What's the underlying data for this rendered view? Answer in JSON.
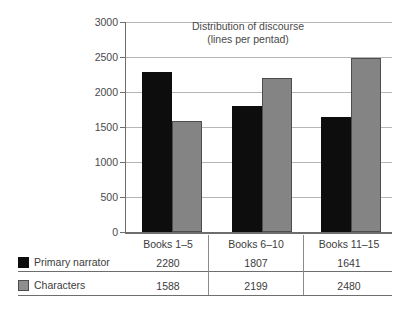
{
  "chart_data": {
    "type": "bar",
    "title": "Distribution of discourse",
    "subtitle": "(lines per pentad)",
    "xlabel": "",
    "ylabel": "",
    "ylim": [
      0,
      3000
    ],
    "ytick_values": [
      3000,
      2500,
      2000,
      1500,
      1000,
      500,
      0
    ],
    "ytick_labels": [
      "3000",
      "2500",
      "2000",
      "1500",
      "1000",
      "500",
      "0"
    ],
    "grid": true,
    "legend_position": "bottom-table",
    "categories": [
      "Books 1–5",
      "Books 6–10",
      "Books 11–15"
    ],
    "series": [
      {
        "name": "Primary narrator",
        "color": "#0d0d0d",
        "values": [
          2280,
          1807,
          1641
        ],
        "value_labels": [
          "2280",
          "1807",
          "1641"
        ]
      },
      {
        "name": "Characters",
        "color": "#848484",
        "values": [
          1588,
          2199,
          2480
        ],
        "value_labels": [
          "1588",
          "2199",
          "2480"
        ]
      }
    ]
  },
  "table": {
    "column_headers": [
      "Books 1–5",
      "Books 6–10",
      "Books 11–15"
    ],
    "rows": [
      {
        "label": "Primary narrator",
        "swatch": "black-square-swatch",
        "cells": [
          "2280",
          "1807",
          "1641"
        ]
      },
      {
        "label": "Characters",
        "swatch": "gray-square-swatch",
        "cells": [
          "1588",
          "2199",
          "2480"
        ]
      }
    ]
  },
  "colors": {
    "primary_narrator": "#0d0d0d",
    "characters": "#848484",
    "axis": "#6e6e6e",
    "gridline": "#b6b6b6",
    "text": "#3c3c3c"
  }
}
